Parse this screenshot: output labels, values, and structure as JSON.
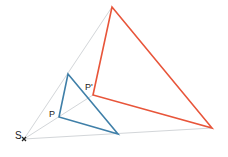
{
  "diagram": {
    "type": "central-projection / homothety",
    "center": {
      "label": "S",
      "marker": "×",
      "x": 24,
      "y": 139
    },
    "original_triangle": {
      "color": "#3f7fa8",
      "vertices": [
        {
          "label": "P",
          "x": 59,
          "y": 117
        },
        {
          "label": "",
          "x": 68,
          "y": 74
        },
        {
          "label": "",
          "x": 118,
          "y": 134
        }
      ]
    },
    "image_triangle": {
      "color": "#e8553a",
      "vertices": [
        {
          "label": "P'",
          "x": 93,
          "y": 95
        },
        {
          "label": "",
          "x": 112,
          "y": 7
        },
        {
          "label": "",
          "x": 212,
          "y": 128
        }
      ]
    },
    "projection_lines_color": "#d3d6d9",
    "labels": {
      "s": "S",
      "s_marker": "×",
      "p": "P",
      "p_prime": "P'"
    }
  }
}
